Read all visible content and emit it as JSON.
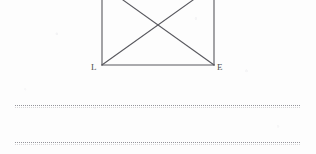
{
  "document": {
    "kind": "scanned-worksheet",
    "background_color": "#fdfdfd",
    "width": 316,
    "height": 154
  },
  "figure": {
    "name": "rectangle-with-diagonals",
    "stroke_color": "#58585e",
    "stroke_width": 1.1,
    "cropped_at_top": true,
    "rect": {
      "left_x": 102,
      "right_x": 214,
      "bottom_y": 65,
      "top_y": -6
    },
    "diagonals": {
      "count": 2,
      "intersection_x": 158,
      "intersection_y": 25
    },
    "vertex_labels": [
      {
        "name": "bottom-left-vertex-label",
        "text": "L",
        "x": 91,
        "y": 63
      },
      {
        "name": "bottom-right-vertex-label",
        "text": "E",
        "x": 217,
        "y": 63
      }
    ]
  },
  "rules": {
    "color": "#5a5a64",
    "style": "dotted",
    "left_x": 15,
    "right_x": 300,
    "lines": [
      {
        "name": "ruled-line-1",
        "y": 105
      },
      {
        "name": "ruled-line-2",
        "y": 142
      }
    ]
  }
}
